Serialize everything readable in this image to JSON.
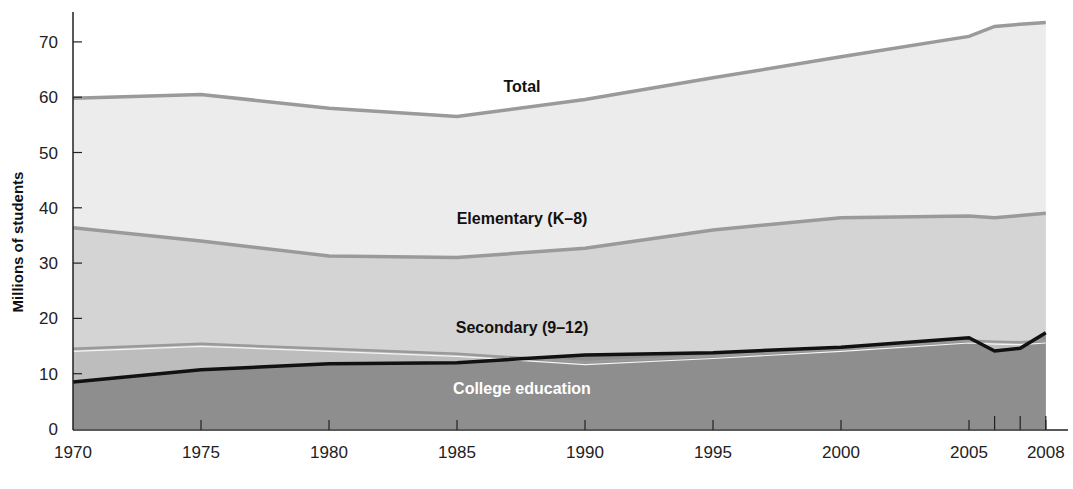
{
  "chart_data": {
    "type": "area",
    "title": "",
    "xlabel": "",
    "ylabel": "Millions of students",
    "ylim": [
      0,
      75
    ],
    "grid": false,
    "legend": "inline labels",
    "x": [
      1970,
      1975,
      1980,
      1985,
      1990,
      1995,
      2000,
      2005,
      2006,
      2007,
      2008
    ],
    "x_ticks": [
      "1970",
      "1975",
      "1980",
      "1985",
      "1990",
      "1995",
      "2000",
      "2005",
      "2008"
    ],
    "x_minor_ticks": [
      2006,
      2007
    ],
    "y_ticks": [
      "0",
      "10",
      "20",
      "30",
      "40",
      "50",
      "60",
      "70"
    ],
    "series": [
      {
        "name": "Total",
        "values": [
          59.8,
          60.5,
          58.0,
          56.5,
          59.6,
          63.5,
          67.3,
          71.0,
          72.8,
          73.2,
          73.5
        ]
      },
      {
        "name": "Elementary (K–8)",
        "values": [
          36.4,
          34.0,
          31.3,
          31.0,
          32.7,
          36.0,
          38.2,
          38.5,
          38.2,
          38.6,
          39.0
        ]
      },
      {
        "name": "Secondary (9–12)",
        "values": [
          14.5,
          15.4,
          14.5,
          13.6,
          12.1,
          13.2,
          14.5,
          16.0,
          15.8,
          15.7,
          16.0
        ]
      },
      {
        "name": "College education",
        "values": [
          8.5,
          10.7,
          11.8,
          12.0,
          13.4,
          13.8,
          14.8,
          16.5,
          14.1,
          14.6,
          17.4
        ]
      }
    ],
    "colors": {
      "total_fill": "#ececec",
      "elementary_fill": "#d4d4d4",
      "secondary_fill": "#bdbdbd",
      "college_fill": "#8e8e8e",
      "band_line": "#9a9a9a",
      "college_line": "#111111"
    }
  },
  "labels": {
    "total": "Total",
    "elementary": "Elementary (K–8)",
    "secondary": "Secondary (9–12)",
    "college": "College education",
    "yaxis": "Millions of students"
  }
}
